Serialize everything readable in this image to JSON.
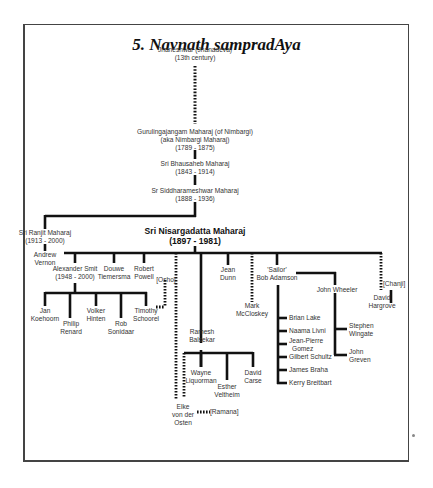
{
  "title": "5. Navnath sampradAya",
  "nodes": {
    "jnaneshwar": {
      "line1": "Jnaneshwar (Jnanadeva)",
      "line2": "(13th century)"
    },
    "gurulingajangam": {
      "line1": "Gurulingajangam Maharaj (of Nimbargi)",
      "line2": "(aka Nimbargi Maharaj)",
      "line3": "(1789 - 1875)"
    },
    "bhausaheb": {
      "line1": "Sri Bhausaheb Maharaj",
      "line2": "(1843 - 1914)"
    },
    "siddharameshwar": {
      "line1": "Sr Siddharameshwar Maharaj",
      "line2": "(1888 - 1936)"
    },
    "ranjit": {
      "line1": "Sri Ranjit Maharaj",
      "line2": "(1913 - 2000)"
    },
    "andrew": {
      "line1": "Andrew",
      "line2": "Vernon"
    },
    "nisargadatta": {
      "line1": "Sri Nisargadatta Maharaj",
      "line2": "(1897 - 1981)"
    },
    "alexander": {
      "line1": "Alexander Smit",
      "line2": "(1948 - 2000)"
    },
    "douwe": {
      "line1": "Douwe",
      "line2": "Tiemersma"
    },
    "robert": {
      "line1": "Robert",
      "line2": "Powell"
    },
    "osho": {
      "line1": "[Osho]"
    },
    "jan": {
      "line1": "Jan",
      "line2": "Koehoorn"
    },
    "philip": {
      "line1": "Philip",
      "line2": "Renard"
    },
    "volker": {
      "line1": "Volker",
      "line2": "Hinten"
    },
    "rob": {
      "line1": "Rob",
      "line2": "Sonidaar"
    },
    "timothy": {
      "line1": "Timothy",
      "line2": "Schoorel"
    },
    "ramesh": {
      "line1": "Ramesh",
      "line2": "Balsekar"
    },
    "wayne": {
      "line1": "Wayne",
      "line2": "Liquorman"
    },
    "esther": {
      "line1": "Esther",
      "line2": "Veltheim"
    },
    "davidc": {
      "line1": "David",
      "line2": "Carse"
    },
    "elke": {
      "line1": "Elke",
      "line2": "von der",
      "line3": "Osten"
    },
    "ramana": {
      "line1": "[Ramana]"
    },
    "jean": {
      "line1": "Jean",
      "line2": "Dunn"
    },
    "mark": {
      "line1": "Mark",
      "line2": "McCloskey"
    },
    "bob": {
      "line1": "'Sailor'",
      "line2": "Bob Adamson"
    },
    "johnw": {
      "line1": "John Wheeler"
    },
    "brian": {
      "line1": "Brian Lake"
    },
    "naama": {
      "line1": "Naama Livni"
    },
    "jeanpierre": {
      "line1": "Jean-Pierre",
      "line2": "Gomez"
    },
    "gilbert": {
      "line1": "Gilbert Schultz"
    },
    "james": {
      "line1": "James Braha"
    },
    "kerry": {
      "line1": "Kerry Breitbart"
    },
    "stephen": {
      "line1": "Stephen",
      "line2": "Wingate"
    },
    "johng": {
      "line1": "John",
      "line2": "Greven"
    },
    "davidh": {
      "line1": "David",
      "line2": "Hargrove"
    },
    "chanji": {
      "line1": "[Chanji]"
    }
  },
  "colors": {
    "line": "#111111",
    "text": "#333333",
    "border": "#444444"
  }
}
